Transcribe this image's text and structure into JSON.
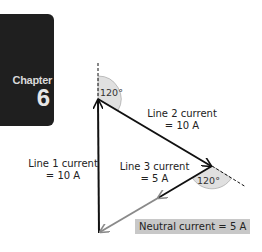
{
  "chapter_tab": {
    "word": "Chapter",
    "number": "6"
  },
  "diagram": {
    "angles": {
      "top": "120°",
      "right": "120°"
    },
    "labels": {
      "line1": [
        "Line 1 current",
        "= 10 A"
      ],
      "line2": [
        "Line 2 current",
        "= 10 A"
      ],
      "line3": [
        "Line 3 current",
        "= 5 A"
      ],
      "neutral": "Neutral current = 5 A"
    },
    "colors": {
      "vector": "#111111",
      "neutral_vector": "#8a8a8a",
      "angle_fill": "#e0e0e0",
      "neutral_label_bg": "#c8c8c8",
      "chapter_tab_bg": "#1f1f1f"
    }
  }
}
